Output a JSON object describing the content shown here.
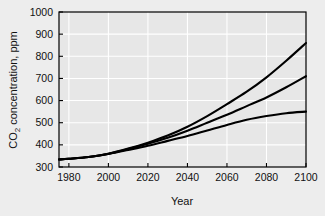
{
  "chart_data": {
    "type": "line",
    "title": "",
    "xlabel": "Year",
    "ylabel_main": "CO",
    "ylabel_sub": "2",
    "ylabel_rest": " concentration, ppm",
    "ylabel_full": "CO2 concentration, ppm",
    "xlim": [
      1975,
      2100
    ],
    "ylim": [
      300,
      1000
    ],
    "xticks": [
      1980,
      2000,
      2020,
      2040,
      2060,
      2080,
      2100
    ],
    "yticks": [
      300,
      400,
      500,
      600,
      700,
      800,
      900,
      1000
    ],
    "grid": true,
    "legend": "none",
    "x": [
      1975,
      1980,
      1990,
      2000,
      2010,
      2020,
      2030,
      2040,
      2050,
      2060,
      2070,
      2080,
      2090,
      2100
    ],
    "series": [
      {
        "name": "high-scenario",
        "values": [
          334,
          337,
          345,
          360,
          383,
          410,
          442,
          482,
          530,
          584,
          640,
          705,
          780,
          860
        ]
      },
      {
        "name": "mid-scenario",
        "values": [
          334,
          337,
          345,
          360,
          381,
          405,
          432,
          464,
          500,
          536,
          575,
          614,
          660,
          710
        ]
      },
      {
        "name": "low-scenario",
        "values": [
          334,
          337,
          345,
          359,
          377,
          396,
          418,
          440,
          465,
          490,
          513,
          530,
          543,
          550
        ]
      }
    ],
    "colors": {
      "line": "#000000",
      "plot_background": "#e7e7e7",
      "figure_background": "#ededed",
      "grid": "#ffffff",
      "axis": "#000000",
      "text": "#111111"
    },
    "geometry": {
      "plot_left": 59,
      "plot_right": 306,
      "plot_top": 12,
      "plot_bottom": 167
    }
  }
}
